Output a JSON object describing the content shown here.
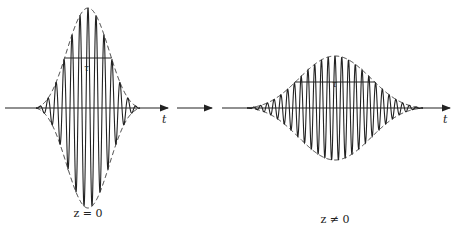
{
  "figure": {
    "left_panel": {
      "caption": "z = 0",
      "width_label": "τ",
      "axis_label": "t",
      "pulse": {
        "center_x": 88,
        "axis_y": 108,
        "amplitude": 100,
        "half_width": 52,
        "cycles": 13
      }
    },
    "right_panel": {
      "caption": "z ≠ 0",
      "width_label": "τ",
      "axis_label": "t",
      "pulse": {
        "center_x": 335,
        "axis_y": 108,
        "amplitude": 52,
        "half_width": 88,
        "cycles": 26
      }
    },
    "transition_arrow": "→",
    "colors": {
      "line": "#222222",
      "background": "#ffffff"
    }
  }
}
